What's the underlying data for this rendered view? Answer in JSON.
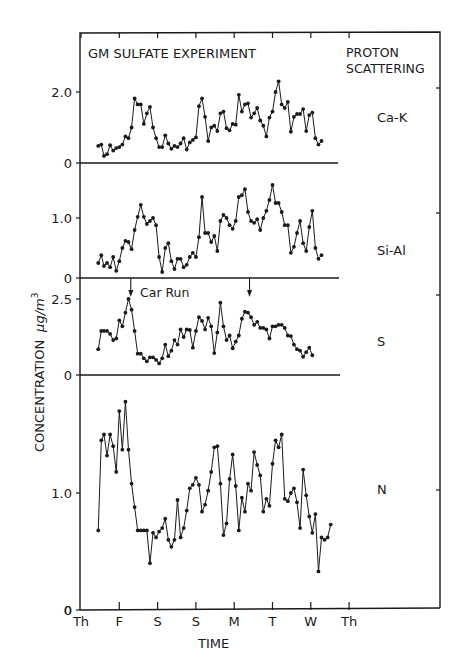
{
  "chart_data": {
    "type": "line",
    "title": "GM SULFATE EXPERIMENT",
    "subtitle": "PROTON SCATTERING",
    "xlabel": "TIME",
    "ylabel": "CONCENTRATION μg/m³",
    "x_ticks": [
      "Th",
      "F",
      "S",
      "S",
      "M",
      "T",
      "W",
      "Th"
    ],
    "x_unit": "days from Thursday (Th=0)",
    "annotation": {
      "text": "Car Run",
      "arrow_x_days": [
        1.3,
        4.4
      ]
    },
    "grid": false,
    "panels": [
      {
        "name": "Ca-K",
        "ylim": [
          0,
          2.6
        ],
        "yticks": [
          {
            "v": 0,
            "label": "0"
          },
          {
            "v": 2.0,
            "label": "2.0"
          }
        ],
        "x": [
          0.45,
          0.53,
          0.6,
          0.68,
          0.76,
          0.84,
          0.92,
          1.0,
          1.08,
          1.16,
          1.24,
          1.32,
          1.4,
          1.48,
          1.56,
          1.64,
          1.72,
          1.8,
          1.88,
          1.96,
          2.04,
          2.12,
          2.2,
          2.28,
          2.36,
          2.44,
          2.52,
          2.6,
          2.68,
          2.76,
          2.84,
          2.92,
          3.0,
          3.08,
          3.16,
          3.24,
          3.32,
          3.4,
          3.48,
          3.56,
          3.64,
          3.72,
          3.8,
          3.88,
          3.96,
          4.04,
          4.12,
          4.2,
          4.28,
          4.36,
          4.44,
          4.52,
          4.6,
          4.68,
          4.76,
          4.84,
          4.92,
          5.0,
          5.08,
          5.16,
          5.24,
          5.32,
          5.4,
          5.48,
          5.56,
          5.64,
          5.72,
          5.8,
          5.88,
          5.96,
          6.04,
          6.12,
          6.2,
          6.28,
          6.36,
          6.44,
          6.52,
          6.6
        ],
        "values": [
          0.48,
          0.52,
          0.2,
          0.25,
          0.5,
          0.35,
          0.42,
          0.45,
          0.52,
          0.75,
          0.7,
          1.0,
          1.82,
          1.65,
          1.65,
          1.1,
          1.4,
          1.58,
          1.0,
          0.7,
          0.45,
          0.45,
          0.78,
          0.55,
          0.4,
          0.48,
          0.45,
          0.55,
          0.7,
          0.38,
          0.58,
          0.65,
          0.72,
          1.6,
          1.82,
          1.3,
          0.62,
          1.0,
          1.05,
          0.9,
          1.4,
          1.45,
          0.98,
          0.92,
          1.1,
          1.08,
          1.92,
          1.45,
          1.65,
          1.68,
          1.28,
          1.4,
          1.55,
          1.2,
          1.05,
          0.75,
          1.28,
          1.45,
          2.0,
          2.3,
          1.65,
          1.55,
          1.72,
          0.88,
          1.3,
          1.38,
          1.38,
          1.52,
          0.9,
          1.35,
          1.42,
          0.7,
          0.52,
          0.62
        ]
      },
      {
        "name": "Si-Al",
        "ylim": [
          0,
          1.65
        ],
        "yticks": [
          {
            "v": 0,
            "label": "0"
          },
          {
            "v": 1.0,
            "label": "1.0"
          }
        ],
        "x": [
          0.45,
          0.53,
          0.6,
          0.68,
          0.76,
          0.84,
          0.92,
          1.0,
          1.08,
          1.16,
          1.24,
          1.32,
          1.4,
          1.48,
          1.56,
          1.64,
          1.72,
          1.8,
          1.88,
          1.96,
          2.04,
          2.12,
          2.2,
          2.28,
          2.36,
          2.44,
          2.52,
          2.6,
          2.68,
          2.76,
          2.84,
          2.92,
          3.0,
          3.08,
          3.16,
          3.24,
          3.32,
          3.4,
          3.48,
          3.56,
          3.64,
          3.72,
          3.8,
          3.88,
          3.96,
          4.04,
          4.12,
          4.2,
          4.28,
          4.36,
          4.44,
          4.52,
          4.6,
          4.68,
          4.76,
          4.84,
          4.92,
          5.0,
          5.08,
          5.16,
          5.24,
          5.32,
          5.4,
          5.48,
          5.56,
          5.64,
          5.72,
          5.8,
          5.88,
          5.96,
          6.04,
          6.12,
          6.2,
          6.28,
          6.36,
          6.44,
          6.52,
          6.6
        ],
        "values": [
          0.25,
          0.38,
          0.2,
          0.25,
          0.18,
          0.35,
          0.12,
          0.28,
          0.5,
          0.62,
          0.6,
          0.48,
          0.8,
          1.02,
          1.22,
          1.02,
          0.9,
          0.95,
          1.0,
          0.88,
          0.35,
          0.1,
          0.5,
          0.58,
          0.28,
          0.15,
          0.32,
          0.32,
          0.18,
          0.22,
          0.35,
          0.42,
          0.35,
          0.68,
          1.35,
          0.75,
          0.75,
          0.6,
          0.7,
          0.45,
          0.95,
          1.05,
          1.0,
          0.88,
          0.82,
          0.95,
          1.35,
          1.38,
          1.48,
          1.1,
          0.95,
          0.92,
          0.98,
          0.8,
          1.0,
          1.12,
          1.3,
          1.55,
          1.25,
          1.25,
          1.1,
          0.88,
          0.88,
          0.42,
          0.52,
          0.75,
          0.95,
          0.58,
          0.45,
          0.85,
          1.12,
          0.5,
          0.32,
          0.38
        ]
      },
      {
        "name": "S",
        "ylim": [
          0,
          2.7
        ],
        "yticks": [
          {
            "v": 0,
            "label": "0"
          },
          {
            "v": 2.5,
            "label": "2.5"
          }
        ],
        "x": [
          0.45,
          0.53,
          0.6,
          0.68,
          0.76,
          0.84,
          0.92,
          1.0,
          1.08,
          1.16,
          1.24,
          1.32,
          1.4,
          1.48,
          1.56,
          1.64,
          1.72,
          1.8,
          1.88,
          1.96,
          2.04,
          2.12,
          2.2,
          2.28,
          2.36,
          2.44,
          2.52,
          2.6,
          2.68,
          2.76,
          2.84,
          2.92,
          3.0,
          3.08,
          3.16,
          3.24,
          3.32,
          3.4,
          3.48,
          3.56,
          3.64,
          3.72,
          3.8,
          3.88,
          3.96,
          4.04,
          4.12,
          4.2,
          4.28,
          4.36,
          4.44,
          4.52,
          4.6,
          4.68,
          4.76,
          4.84,
          4.92,
          5.0,
          5.08,
          5.16,
          5.24,
          5.32,
          5.4,
          5.48,
          5.56,
          5.64,
          5.72,
          5.8,
          5.88,
          5.96,
          6.04,
          6.12,
          6.2,
          6.28,
          6.36,
          6.44,
          6.52,
          6.6
        ],
        "values": [
          0.85,
          1.45,
          1.45,
          1.45,
          1.35,
          1.15,
          1.2,
          1.8,
          1.6,
          2.05,
          2.5,
          2.15,
          1.45,
          0.7,
          0.7,
          0.55,
          0.45,
          0.58,
          0.58,
          0.5,
          0.38,
          0.55,
          1.0,
          0.62,
          0.8,
          1.15,
          1.0,
          1.5,
          1.25,
          1.5,
          1.48,
          0.9,
          1.45,
          1.9,
          1.78,
          1.5,
          1.88,
          1.6,
          0.72,
          1.4,
          2.38,
          1.6,
          1.15,
          1.3,
          0.88,
          1.1,
          1.3,
          1.85,
          2.08,
          2.05,
          1.9,
          1.65,
          1.75,
          1.55,
          1.55,
          1.5,
          1.2,
          1.6,
          1.6,
          1.65,
          1.65,
          1.55,
          1.3,
          1.28,
          1.0,
          0.85,
          0.8,
          0.6,
          0.75,
          0.9,
          0.65
        ],
        "x_s": "index-aligned to first values.length x entries"
      },
      {
        "name": "N",
        "ylim": [
          0,
          1.95
        ],
        "yticks": [
          {
            "v": 0,
            "label": "0"
          },
          {
            "v": 1.0,
            "label": "1.0"
          }
        ],
        "x": [
          0.45,
          0.53,
          0.6,
          0.68,
          0.76,
          0.84,
          0.92,
          1.0,
          1.08,
          1.16,
          1.24,
          1.32,
          1.4,
          1.48,
          1.56,
          1.64,
          1.72,
          1.8,
          1.88,
          1.96,
          2.04,
          2.12,
          2.2,
          2.28,
          2.36,
          2.44,
          2.52,
          2.6,
          2.68,
          2.76,
          2.84,
          2.92,
          3.0,
          3.08,
          3.16,
          3.24,
          3.32,
          3.4,
          3.48,
          3.56,
          3.64,
          3.72,
          3.8,
          3.88,
          3.96,
          4.04,
          4.12,
          4.2,
          4.28,
          4.36,
          4.44,
          4.52,
          4.6,
          4.68,
          4.76,
          4.84,
          4.92,
          5.0,
          5.08,
          5.16,
          5.24,
          5.32,
          5.4,
          5.48,
          5.56,
          5.64,
          5.72,
          5.8,
          5.88,
          5.96,
          6.04,
          6.12,
          6.2,
          6.28,
          6.36,
          6.44,
          6.52,
          6.6
        ],
        "values": [
          0.68,
          1.45,
          1.5,
          1.32,
          1.5,
          1.4,
          1.18,
          1.7,
          1.37,
          1.78,
          1.37,
          1.08,
          0.88,
          0.68,
          0.68,
          0.68,
          0.68,
          0.4,
          0.66,
          0.62,
          0.67,
          0.7,
          0.78,
          0.6,
          0.54,
          0.6,
          0.94,
          0.62,
          0.7,
          0.85,
          1.04,
          1.07,
          1.13,
          1.07,
          0.84,
          0.9,
          1.02,
          1.18,
          1.39,
          1.4,
          1.08,
          0.64,
          0.74,
          1.12,
          1.33,
          1.06,
          0.68,
          0.96,
          0.84,
          1.08,
          1.02,
          1.35,
          1.24,
          1.15,
          0.84,
          0.95,
          0.89,
          1.25,
          1.45,
          1.39,
          1.5,
          0.95,
          0.93,
          1.0,
          1.04,
          0.92,
          0.7,
          1.2,
          0.98,
          0.8,
          0.66,
          0.82,
          0.33,
          0.62,
          0.6,
          0.62,
          0.73
        ]
      }
    ],
    "legend": null
  },
  "labels": {
    "title": "GM SULFATE EXPERIMENT",
    "subtitle_line1": "PROTON",
    "subtitle_line2": "SCATTERING",
    "xlabel": "TIME",
    "ylabel": "CONCENTRATION",
    "ylabel_unit": "μg/m",
    "ylabel_exp": "3",
    "car_run": "Car Run"
  }
}
